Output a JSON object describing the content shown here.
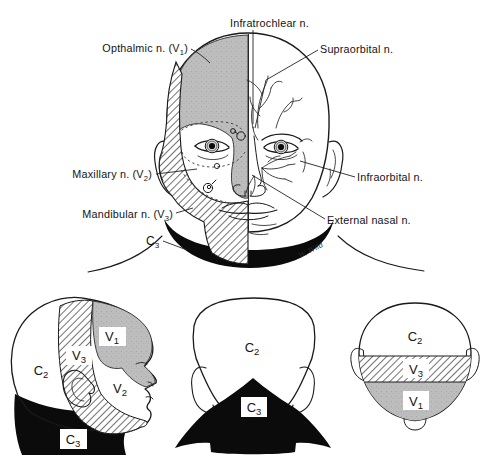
{
  "colors": {
    "region_gray": "#bdbdbd",
    "ink": "#1a1a1a",
    "black_fill": "#0b0b0b",
    "background": "#ffffff"
  },
  "main_figure": {
    "labels": {
      "infratrochlear": {
        "text": "Infratrochlear n."
      },
      "ophthalmic": {
        "pre": "Opthalmic n. (V",
        "sub": "1",
        "post": ")"
      },
      "supraorbital": {
        "text": "Supraorbital n."
      },
      "maxillary": {
        "pre": "Maxillary n. (V",
        "sub": "2",
        "post": ")"
      },
      "mandibular": {
        "pre": "Mandibular n. (V",
        "sub": "3",
        "post": ")"
      },
      "c3": {
        "pre": "C",
        "sub": "3"
      },
      "infraorbital": {
        "text": "Infraorbital n."
      },
      "external_nasal": {
        "text": "External nasal n."
      }
    },
    "signature": "W. Wild"
  },
  "lateral_view": {
    "labels": {
      "v1": {
        "pre": "V",
        "sub": "1"
      },
      "v3": {
        "pre": "V",
        "sub": "3"
      },
      "c2": {
        "pre": "C",
        "sub": "2"
      },
      "v2": {
        "pre": "V",
        "sub": "2"
      },
      "c3": {
        "pre": "C",
        "sub": "3"
      }
    }
  },
  "posterior_view": {
    "labels": {
      "c2": {
        "pre": "C",
        "sub": "2"
      },
      "c3": {
        "pre": "C",
        "sub": "3"
      }
    }
  },
  "vertex_view": {
    "labels": {
      "c2": {
        "pre": "C",
        "sub": "2"
      },
      "v3": {
        "pre": "V",
        "sub": "3"
      },
      "v1": {
        "pre": "V",
        "sub": "1"
      }
    }
  }
}
